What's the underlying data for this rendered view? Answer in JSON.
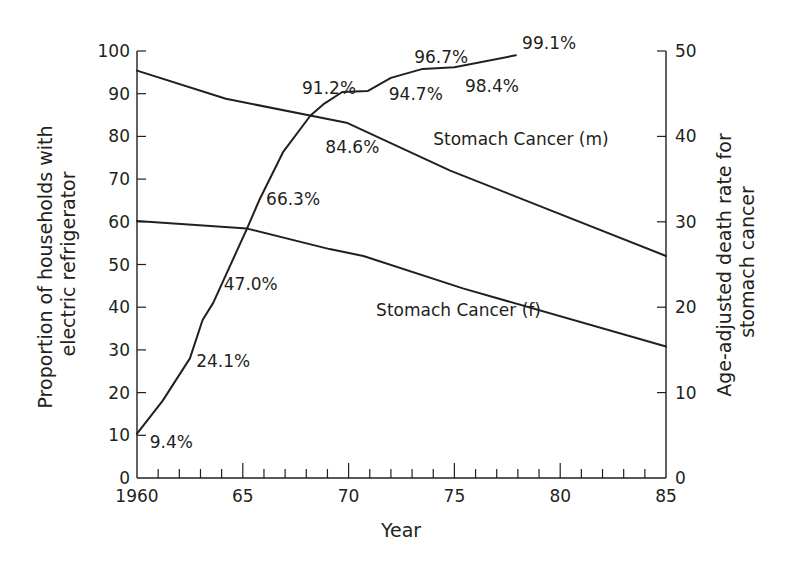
{
  "chart_data": {
    "type": "line",
    "title": "",
    "xlabel": "Year",
    "ylabel_left": "Proportion of households with electric refrigerator",
    "ylabel_left_lines": [
      "Proportion of households with",
      "electric refrigerator"
    ],
    "ylabel_right": "Age-adjusted death rate for stomach cancer",
    "ylabel_right_lines": [
      "Age-adjusted death rate for",
      "stomach cancer"
    ],
    "xlim": [
      1960,
      1985
    ],
    "ylim_left": [
      0,
      100
    ],
    "ylim_right": [
      0,
      50
    ],
    "x_ticks_major": [
      1960,
      1965,
      1970,
      1975,
      1980,
      1985
    ],
    "x_tick_labels": [
      "1960",
      "65",
      "70",
      "75",
      "80",
      "85"
    ],
    "x_ticks_minor_step": 1,
    "y_left_ticks": [
      0,
      10,
      20,
      30,
      40,
      50,
      60,
      70,
      80,
      90,
      100
    ],
    "y_right_ticks": [
      0,
      10,
      20,
      30,
      40,
      50
    ],
    "grid": false,
    "legend": "inline labels",
    "series": [
      {
        "name": "Households with electric refrigerator (%)",
        "axis": "left",
        "x": [
          1960,
          1961.2,
          1962.5,
          1963.1,
          1963.6,
          1965.2,
          1965.8,
          1966.9,
          1968.2,
          1968.8,
          1969.7,
          1970.9,
          1972.0,
          1973.5,
          1975.0,
          1977.9
        ],
        "values": [
          10.4,
          18,
          28,
          37,
          41,
          58.4,
          65.3,
          76.3,
          84.9,
          87.5,
          90.4,
          90.6,
          93.7,
          95.8,
          96.2,
          99.0
        ]
      },
      {
        "name": "Stomach Cancer (m)",
        "axis": "right",
        "x": [
          1960,
          1964.2,
          1969.9,
          1974.8,
          1985
        ],
        "values": [
          47.7,
          44.4,
          41.6,
          36.0,
          26.0
        ]
      },
      {
        "name": "Stomach Cancer (f)",
        "axis": "right",
        "x": [
          1960,
          1965.2,
          1969.1,
          1970.7,
          1975.4,
          1985
        ],
        "values": [
          30.1,
          29.2,
          26.8,
          26.0,
          22.2,
          15.4
        ]
      }
    ],
    "annotations": [
      {
        "text": "9.4%",
        "x": 1960.6,
        "y": 7
      },
      {
        "text": "24.1%",
        "x": 1962.8,
        "y": 26
      },
      {
        "text": "47.0%",
        "x": 1964.1,
        "y": 44
      },
      {
        "text": "66.3%",
        "x": 1966.1,
        "y": 64
      },
      {
        "text": "84.6%",
        "x": 1968.9,
        "y": 76
      },
      {
        "text": "91.2%",
        "x": 1967.8,
        "y": 90
      },
      {
        "text": "94.7%",
        "x": 1971.9,
        "y": 88.5
      },
      {
        "text": "96.7%",
        "x": 1973.1,
        "y": 97.2
      },
      {
        "text": "98.4%",
        "x": 1975.5,
        "y": 90.5
      },
      {
        "text": "99.1%",
        "x": 1978.2,
        "y": 100.5
      }
    ],
    "series_labels": [
      {
        "text": "Stomach Cancer (m)",
        "x": 1974.0,
        "y": 78
      },
      {
        "text": "Stomach Cancer (f)",
        "x": 1971.3,
        "y": 38
      }
    ]
  }
}
